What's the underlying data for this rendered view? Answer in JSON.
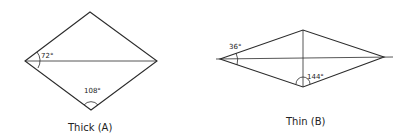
{
  "diagram": {
    "thick": {
      "caption": "Thick (A)",
      "angle_left": "72°",
      "angle_bottom": "108°"
    },
    "thin": {
      "caption": "Thin (B)",
      "angle_left": "36°",
      "angle_bottom": "144°"
    }
  }
}
